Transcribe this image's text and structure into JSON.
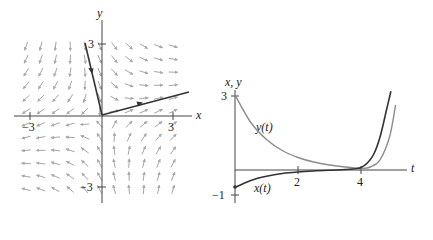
{
  "chart_data": [
    {
      "type": "direction-field",
      "title": "",
      "xlabel": "x",
      "ylabel": "y",
      "xlim": [
        -3.7,
        3.8
      ],
      "ylim": [
        -3.6,
        4.0
      ],
      "x_ticks": [
        {
          "v": -3,
          "label": "−3"
        },
        {
          "v": 3,
          "label": "3"
        }
      ],
      "y_ticks": [
        {
          "v": 3,
          "label": "3"
        },
        {
          "v": -3,
          "label": "−3"
        }
      ],
      "trajectories": [
        {
          "name": "incoming",
          "points": [
            [
              -0.7,
              3.05
            ],
            [
              0,
              0
            ]
          ],
          "arrow_at": [
            -0.45,
            1.9
          ],
          "direction": "toward-origin",
          "color": "#333333"
        },
        {
          "name": "outgoing",
          "points": [
            [
              0,
              0
            ],
            [
              3.7,
              1.0
            ]
          ],
          "arrow_at": [
            1.55,
            0.45
          ],
          "direction": "away-from-origin",
          "color": "#333333"
        }
      ],
      "field_color": "#9a9a9a",
      "grid": false
    },
    {
      "type": "line",
      "title": "",
      "xlabel": "t",
      "ylabel": "x, y",
      "xlim": [
        0,
        5.4
      ],
      "ylim": [
        -1,
        3.2
      ],
      "x_ticks": [
        {
          "v": 2,
          "label": "2"
        },
        {
          "v": 4,
          "label": "4"
        }
      ],
      "y_ticks": [
        {
          "v": 3,
          "label": "3"
        },
        {
          "v": -1,
          "label": "−1"
        }
      ],
      "series": [
        {
          "name": "y(t)",
          "label": "y(t)",
          "color": "#8c8c8c",
          "t": [
            0,
            0.5,
            1,
            1.5,
            2,
            2.5,
            3,
            3.5,
            3.8,
            4.0,
            4.3,
            4.6,
            4.9,
            5.1
          ],
          "values": [
            3.0,
            1.9,
            1.22,
            0.78,
            0.5,
            0.32,
            0.2,
            0.12,
            0.08,
            0.06,
            0.12,
            0.4,
            1.3,
            2.6
          ]
        },
        {
          "name": "x(t)",
          "label": "x(t)",
          "color": "#333333",
          "t": [
            0,
            0.5,
            1,
            1.5,
            2,
            2.5,
            3,
            3.5,
            3.8,
            4.0,
            4.2,
            4.4,
            4.6,
            4.8,
            4.95
          ],
          "values": [
            -0.7,
            -0.42,
            -0.25,
            -0.14,
            -0.08,
            -0.04,
            -0.01,
            0.02,
            0.05,
            0.1,
            0.28,
            0.62,
            1.3,
            2.35,
            3.15
          ]
        }
      ],
      "grid": false,
      "legend": "inline labels"
    }
  ],
  "left_plot": {
    "x_label": "x",
    "y_label": "y",
    "tick_pos_x": "3",
    "tick_neg_x": "−3",
    "tick_pos_y": "3",
    "tick_neg_y": "−3"
  },
  "right_plot": {
    "axis_label_vertical": "x, y",
    "axis_label_t": "t",
    "tick_3": "3",
    "tick_neg1": "−1",
    "tick_2": "2",
    "tick_4": "4",
    "y_series_label": "y(t)",
    "x_series_label": "x(t)"
  }
}
